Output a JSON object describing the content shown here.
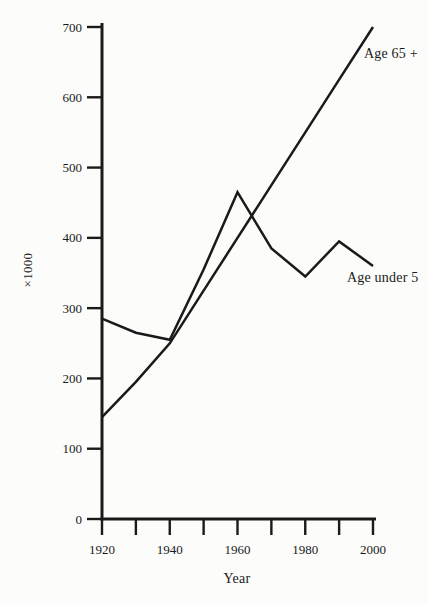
{
  "page": {
    "background": "#fcfcfb",
    "ink": "#1a1a1a"
  },
  "chart_data": {
    "type": "line",
    "title": "",
    "xlabel": "Year",
    "ylabel": "×1000",
    "xlim": [
      1920,
      2000
    ],
    "ylim": [
      0,
      700
    ],
    "grid": false,
    "legend_position": "inline labels next to lines",
    "x": [
      1920,
      1930,
      1940,
      1950,
      1960,
      1970,
      1980,
      1990,
      2000
    ],
    "x_tick_labels": [
      "1920",
      "1940",
      "1960",
      "1980",
      "2000"
    ],
    "yticks": [
      0,
      100,
      200,
      300,
      400,
      500,
      600,
      700
    ],
    "series": [
      {
        "name": "Age 65 +",
        "values": [
          145,
          195,
          250,
          325,
          400,
          475,
          550,
          625,
          700
        ]
      },
      {
        "name": "Age under 5",
        "values": [
          285,
          265,
          255,
          355,
          465,
          385,
          345,
          395,
          360
        ]
      }
    ]
  }
}
